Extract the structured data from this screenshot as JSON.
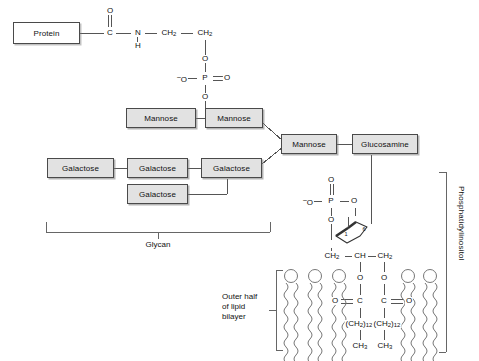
{
  "figure": {
    "box_fill": "#e2e2e2",
    "line_color": "#555555",
    "text_color": "#111111"
  },
  "boxes": {
    "protein": "Protein",
    "mannose_a": "Mannose",
    "mannose_b": "Mannose",
    "mannose_core": "Mannose",
    "glucosamine": "Glucosamine",
    "galactose_1": "Galactose",
    "galactose_2": "Galactose",
    "galactose_3": "Galactose",
    "galactose_4": "Galactose"
  },
  "atoms": {
    "carbonyl_o_top": "O",
    "amide_c": "C",
    "amide_n": "N",
    "amide_h": "H",
    "ethanolamine_ch2_a": "CH2",
    "ethanolamine_ch2_b": "CH2",
    "phos1_o_up": "O",
    "phos1_o_left": "O",
    "phos1_p": "P",
    "phos1_o_right": "O",
    "phos1_o_down": "O",
    "phos2_o_up": "O",
    "phos2_o_left": "O",
    "phos2_p": "P",
    "phos2_o_right": "O",
    "phos2_o_down": "O",
    "inositol_c1": "1",
    "inositol_c6": "6",
    "glycerol_ch2_left": "CH2",
    "glycerol_ch": "CH",
    "glycerol_ch2_right": "CH2",
    "ester_o_left": "O",
    "ester_o_right": "O",
    "carbonyl_left_o": "O",
    "carbonyl_left_c": "C",
    "carbonyl_right_c": "C",
    "carbonyl_right_o": "O",
    "chain_left": "(CH2)12",
    "chain_right": "(CH2)12",
    "methyl_left": "CH3",
    "methyl_right": "CH3",
    "minus_charge": "–"
  },
  "brackets": {
    "glycan_label": "Glycan",
    "outer_half_label_line1": "Outer half",
    "outer_half_label_line2": "of lipid",
    "outer_half_label_line3": "bilayer",
    "phosphatidylinositol_label": "Phosphatidylinositol"
  }
}
